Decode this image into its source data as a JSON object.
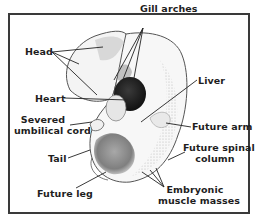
{
  "diagram": {
    "subject": "Embryo",
    "labels": {
      "head": "Head",
      "gill_arches": "Gill arches",
      "heart": "Heart",
      "liver": "Liver",
      "severed_umbilical_cord_line1": "Severed",
      "severed_umbilical_cord_line2": "umbilical cord",
      "future_arm": "Future arm",
      "tail": "Tail",
      "future_spinal_column_line1": "Future spinal",
      "future_spinal_column_line2": "column",
      "future_leg": "Future leg",
      "embryonic_muscle_masses_line1": "Embryonic",
      "embryonic_muscle_masses_line2": "muscle masses"
    },
    "colors": {
      "ink": "#1e1e1e",
      "border": "#3a3a3a",
      "background": "#ffffff"
    }
  }
}
